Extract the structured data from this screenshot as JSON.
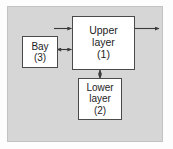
{
  "figure": {
    "panel_color": "#d6d6d6",
    "box_fill_color": "#ffffff",
    "box_border_color": "#4a4a4a",
    "arrow_color": "#3a3a3a"
  },
  "nodes": {
    "upper": {
      "name": "Upper layer",
      "line1": "Upper",
      "line2": "layer",
      "index": "(1)"
    },
    "lower": {
      "name": "Lower layer",
      "line1": "Lower",
      "line2": "layer",
      "index": "(2)"
    },
    "bay": {
      "name": "Bay",
      "line1": "Bay",
      "index": "(3)"
    }
  },
  "arrows": [
    {
      "id": "inflow-to-upper",
      "from": "external-left",
      "to": "upper",
      "direction": "right",
      "heads": 1
    },
    {
      "id": "outflow-from-upper",
      "from": "upper",
      "to": "external-right",
      "direction": "right",
      "heads": 1
    },
    {
      "id": "bay-upper-exchange",
      "from": "bay",
      "to": "upper",
      "direction": "bidirectional",
      "heads": 2
    },
    {
      "id": "upper-lower-exchange",
      "from": "upper",
      "to": "lower",
      "direction": "bidirectional",
      "heads": 2
    }
  ]
}
